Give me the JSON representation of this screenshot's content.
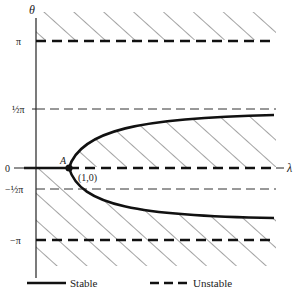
{
  "axes": {
    "y_label": "θ",
    "x_label": "λ",
    "y_ticks": [
      {
        "value": "pi",
        "label": "π"
      },
      {
        "value": "half_pi",
        "label": "½π"
      },
      {
        "value": "zero",
        "label": "0"
      },
      {
        "value": "neg_half_pi",
        "label": "−½π"
      },
      {
        "value": "neg_pi",
        "label": "−π"
      }
    ]
  },
  "point": {
    "name": "A",
    "coords_label": "(1,0)"
  },
  "legend": {
    "stable_label": "Stable",
    "unstable_label": "Unstable"
  },
  "colors": {
    "ink": "#111111",
    "hatch": "#333333"
  }
}
